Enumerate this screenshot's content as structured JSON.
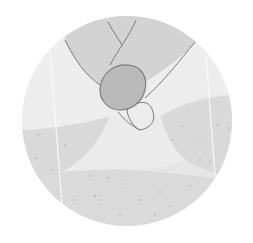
{
  "illustration": {
    "description": "Circular close-up of a fingertip touching a tapered surface between ridged areas",
    "subject": "fingertip-touch",
    "colors": {
      "background": "#ffffff",
      "circle_base": "#e4e4e4",
      "upper_light": "#ececec",
      "finger_fill": "#d2d2d2",
      "finger_outline": "#7a7a7a",
      "nail_fill": "#b9b9b9",
      "lower_band": "#d8d8d8",
      "middle_highlight": "#eaeaea",
      "speckle": "#c2c2c2",
      "vertical_line": "#f6f6f6"
    }
  }
}
